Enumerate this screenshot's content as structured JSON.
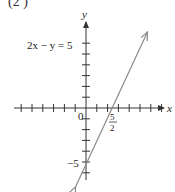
{
  "header_fragment": "(2 )",
  "chart_data": {
    "type": "line",
    "title": "",
    "equation": "2x − y = 5",
    "xlabel": "x",
    "ylabel": "y",
    "origin_label": "0",
    "x_intercept_label": {
      "num": "5",
      "den": "2"
    },
    "y_intercept_label": "−5",
    "xlim": [
      -8,
      9
    ],
    "ylim": [
      -7,
      8
    ],
    "grid": false,
    "series": [
      {
        "name": "2x − y = 5",
        "x": [
          -1,
          0,
          2.5,
          5.5
        ],
        "y": [
          -7,
          -5,
          0,
          6
        ]
      }
    ],
    "intercepts": {
      "x": 2.5,
      "y": -5
    },
    "colors": {
      "line": "#8a8a8a",
      "axes": "#333333"
    }
  }
}
